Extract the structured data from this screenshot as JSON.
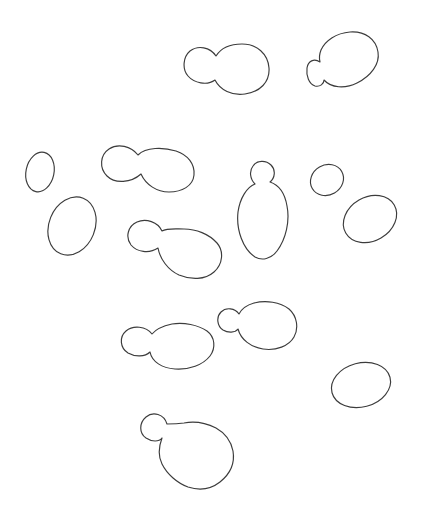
{
  "figure": {
    "canvas": {
      "width": 421,
      "height": 525,
      "background": "#ffffff"
    },
    "style": {
      "stroke_color": "#3c3c3c",
      "stroke_width": 1.15,
      "fill": "none"
    },
    "cells": [
      {
        "id": "budded-yeast-cell-top-center",
        "kind": "path",
        "d": "M216,56 C210,47 198,45 190,51 C183,57 182,69 188,76 C194,83 207,86 215,80 C220,90 232,96 245,94 C260,92 270,82 269,68 C268,54 257,44 242,44 C231,44 221,48 216,56 Z"
      },
      {
        "id": "budded-yeast-cell-top-right",
        "kind": "path",
        "d": "M320,62 C314,58 308,61 307,68 C306,76 309,84 315,86 C320,87 324,84 324,80 C331,88 345,89 357,83 C371,76 380,64 378,52 C376,39 365,31 350,32 C336,33 325,41 321,50 C319,55 319,58 320,62 Z"
      },
      {
        "id": "oval-yeast-cell-left-small",
        "kind": "ellipse",
        "cx": 40,
        "cy": 172,
        "rx": 14,
        "ry": 20,
        "rotate": 12
      },
      {
        "id": "budded-yeast-cell-mid-left",
        "kind": "path",
        "d": "M138,155 C131,146 118,143 109,149 C100,155 99,168 107,176 C115,184 131,183 141,174 C146,185 157,192 169,192 C182,192 193,186 194,175 C195,164 188,155 176,151 C163,147 146,147 138,155 Z"
      },
      {
        "id": "oval-yeast-cell-left-large",
        "kind": "ellipse",
        "cx": 72,
        "cy": 226,
        "rx": 23,
        "ry": 30,
        "rotate": 22
      },
      {
        "id": "budded-yeast-cell-center-vertical",
        "kind": "path",
        "d": "M270,182 C275,178 276,170 271,165 C266,160 257,160 253,166 C249,171 250,179 255,184 C247,187 240,198 238,212 C236,230 243,249 255,257 C262,261 271,259 277,251 C286,239 290,221 287,206 C285,194 279,185 270,182 Z"
      },
      {
        "id": "oval-yeast-cell-right-small",
        "kind": "ellipse",
        "cx": 327,
        "cy": 180,
        "rx": 17,
        "ry": 15,
        "rotate": -30
      },
      {
        "id": "oval-yeast-cell-right-large",
        "kind": "ellipse",
        "cx": 370,
        "cy": 219,
        "rx": 28,
        "ry": 22,
        "rotate": -30
      },
      {
        "id": "budded-yeast-cell-mid-diagonal",
        "kind": "path",
        "d": "M162,231 C158,222 146,218 137,222 C128,226 125,237 131,245 C137,252 149,254 158,248 C160,259 168,270 179,275 C191,280 205,280 214,272 C223,264 224,251 217,243 C209,234 196,229 184,229 C175,229 167,228 162,231 Z"
      },
      {
        "id": "budded-yeast-cell-lower-left",
        "kind": "path",
        "d": "M152,334 C146,326 133,325 126,331 C119,337 120,348 128,353 C135,357 145,357 150,352 C152,362 162,368 175,369 C189,370 203,365 210,356 C216,348 215,337 207,331 C198,325 184,322 172,324 C163,326 156,329 152,334 Z"
      },
      {
        "id": "budded-yeast-cell-lower-right",
        "kind": "path",
        "d": "M239,314 C235,308 226,307 221,312 C216,317 217,326 223,330 C228,333 235,333 238,329 C241,340 251,347 263,349 C276,351 289,346 294,337 C299,328 297,316 289,309 C280,302 266,300 254,303 C247,305 242,308 239,314 Z"
      },
      {
        "id": "oval-yeast-cell-bottom-right",
        "kind": "ellipse",
        "cx": 361,
        "cy": 385,
        "rx": 30,
        "ry": 22,
        "rotate": -15
      },
      {
        "id": "budded-yeast-cell-bottom",
        "kind": "path",
        "d": "M167,424 C164,414 153,411 146,417 C139,423 139,433 146,438 C152,442 159,442 162,438 C159,446 158,456 162,464 C167,474 177,483 188,487 C200,491 211,489 220,482 C230,474 235,463 233,451 C231,441 225,433 216,428 C206,423 194,421 184,423 C177,424 171,424 167,424 Z"
      }
    ]
  }
}
